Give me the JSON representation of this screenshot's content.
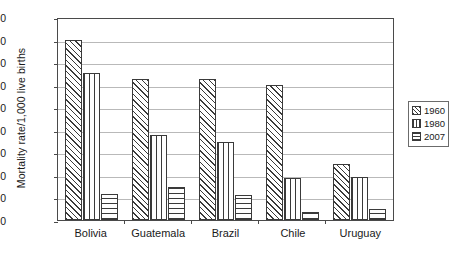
{
  "chart_data": {
    "type": "bar",
    "title": "",
    "xlabel": "",
    "ylabel": "Mortality rate/1,000 live births",
    "ylim": [
      0,
      180
    ],
    "ytick_step": 20,
    "yticks": [
      0,
      20,
      40,
      60,
      80,
      100,
      120,
      140,
      160,
      180
    ],
    "grid": true,
    "legend_position": "right",
    "categories": [
      "Bolivia",
      "Guatemala",
      "Brazil",
      "Chile",
      "Uruguay"
    ],
    "series": [
      {
        "name": "1960",
        "pattern": "diagonal-hatch",
        "values": [
          160,
          125,
          125,
          120,
          50
        ]
      },
      {
        "name": "1980",
        "pattern": "vertical-lines",
        "values": [
          130,
          75,
          69,
          37,
          38
        ]
      },
      {
        "name": "2007",
        "pattern": "crosshatch-grid",
        "values": [
          23,
          29,
          22,
          7,
          10
        ]
      }
    ]
  },
  "legend": {
    "items": [
      {
        "label": "1960"
      },
      {
        "label": "1980"
      },
      {
        "label": "2007"
      }
    ]
  },
  "colors": {
    "ink": "#3a3a3a",
    "frame": "#4a4a4a",
    "grid": "#b9b9b9",
    "background": "#ffffff"
  }
}
